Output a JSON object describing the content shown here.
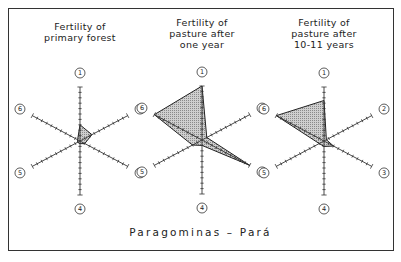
{
  "caption": "Paragominas  –  Pará",
  "axis_labels": [
    "1",
    "2",
    "3",
    "4",
    "5",
    "6"
  ],
  "panels": [
    {
      "title": "Fertility of\nprimary forest",
      "center": [
        80,
        141
      ]
    },
    {
      "title": "Fertility of\npasture  after\none  year",
      "center": [
        202,
        140
      ]
    },
    {
      "title": "Fertility of\npasture  after\n10-11 years",
      "center": [
        324,
        141
      ]
    }
  ],
  "chart_data": [
    {
      "type": "radar",
      "title": "Fertility of primary forest",
      "axes": [
        "1",
        "2",
        "3",
        "4",
        "5",
        "6"
      ],
      "scale_max": 10,
      "ticks_per_axis": 10,
      "values": [
        3,
        2.5,
        1,
        0.5,
        0.5,
        0.5
      ]
    },
    {
      "type": "radar",
      "title": "Fertility of pasture after one year",
      "axes": [
        "1",
        "2",
        "3",
        "4",
        "5",
        "6"
      ],
      "scale_max": 10,
      "ticks_per_axis": 10,
      "values": [
        10,
        1,
        10,
        1,
        2,
        10
      ]
    },
    {
      "type": "radar",
      "title": "Fertility of pasture after 10-11 years",
      "axes": [
        "1",
        "2",
        "3",
        "4",
        "5",
        "6"
      ],
      "scale_max": 10,
      "ticks_per_axis": 10,
      "values": [
        7.5,
        0.5,
        2,
        1,
        1,
        10
      ]
    }
  ]
}
